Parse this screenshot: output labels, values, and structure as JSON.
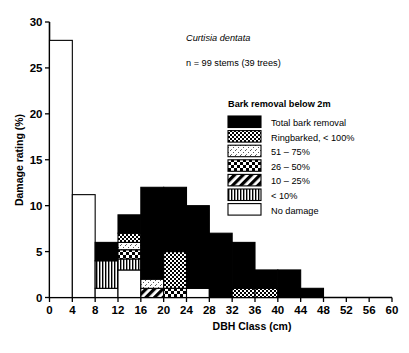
{
  "figure": {
    "species": "Curtisia dentata",
    "sample": "n = 99 stems (39 trees)"
  },
  "legend": {
    "title": "Bark removal below 2m",
    "entries": [
      {
        "key": "total",
        "label": "Total bark removal",
        "pattern": "solid-black"
      },
      {
        "key": "ringbarked",
        "label": "Ringbarked, < 100%",
        "pattern": "checker-dense"
      },
      {
        "key": "p51_75",
        "label": "51 – 75%",
        "pattern": "stipple-light"
      },
      {
        "key": "p26_50",
        "label": "26 – 50%",
        "pattern": "checker-coarse"
      },
      {
        "key": "p10_25",
        "label": "10 – 25%",
        "pattern": "diagonal-hatch"
      },
      {
        "key": "lt10",
        "label": "< 10%",
        "pattern": "vertical-lines"
      },
      {
        "key": "none",
        "label": "No damage",
        "pattern": "white"
      }
    ]
  },
  "chart_data": {
    "type": "bar",
    "subtype": "stacked-histogram",
    "title": "",
    "xlabel": "DBH Class (cm)",
    "ylabel": "Damage rating (%)",
    "xlim": [
      0,
      60
    ],
    "ylim": [
      0,
      30
    ],
    "xticks": [
      0,
      4,
      8,
      12,
      16,
      20,
      24,
      28,
      32,
      36,
      40,
      44,
      48,
      52,
      56,
      60
    ],
    "yticks": [
      0,
      5,
      10,
      15,
      20,
      25,
      30
    ],
    "grid": false,
    "legend_position": "inside-upper-right",
    "bin_width": 4,
    "categories": [
      "0-4",
      "4-8",
      "8-12",
      "12-16",
      "16-20",
      "20-24",
      "24-28",
      "28-32",
      "32-36",
      "36-40",
      "40-44",
      "44-48",
      "48-52",
      "52-56",
      "56-60"
    ],
    "series": [
      {
        "name": "No damage",
        "key": "none",
        "values": [
          28.0,
          11.2,
          1.0,
          3.0,
          0.0,
          0.0,
          1.0,
          0.0,
          0.0,
          0.0,
          0.0,
          0.0,
          0.0,
          0.0,
          0.0
        ]
      },
      {
        "name": "< 10%",
        "key": "lt10",
        "values": [
          0.0,
          0.0,
          3.0,
          1.2,
          0.0,
          0.0,
          0.0,
          0.0,
          0.0,
          0.0,
          0.0,
          0.0,
          0.0,
          0.0,
          0.0
        ]
      },
      {
        "name": "10 – 25%",
        "key": "p10_25",
        "values": [
          0.0,
          0.0,
          0.0,
          0.0,
          1.0,
          0.0,
          0.0,
          0.0,
          0.0,
          0.0,
          0.0,
          0.0,
          0.0,
          0.0,
          0.0
        ]
      },
      {
        "name": "26 – 50%",
        "key": "p26_50",
        "values": [
          0.0,
          0.0,
          0.0,
          1.0,
          0.0,
          1.0,
          0.0,
          0.0,
          0.0,
          0.0,
          0.0,
          0.0,
          0.0,
          0.0,
          0.0
        ]
      },
      {
        "name": "51 – 75%",
        "key": "p51_75",
        "values": [
          0.0,
          0.0,
          0.0,
          0.8,
          1.0,
          0.0,
          0.0,
          0.0,
          0.0,
          0.0,
          0.0,
          0.0,
          0.0,
          0.0,
          0.0
        ]
      },
      {
        "name": "Ringbarked, < 100%",
        "key": "ringbarked",
        "values": [
          0.0,
          0.0,
          0.0,
          1.0,
          0.0,
          4.0,
          0.0,
          0.0,
          1.0,
          1.0,
          0.0,
          0.0,
          0.0,
          0.0,
          0.0
        ]
      },
      {
        "name": "Total bark removal",
        "key": "total",
        "values": [
          0.0,
          0.0,
          2.0,
          2.0,
          10.0,
          7.0,
          9.0,
          7.0,
          5.0,
          2.0,
          3.0,
          1.0,
          0.0,
          0.0,
          0.0
        ]
      }
    ],
    "stack_totals": [
      28.0,
      11.2,
      6.0,
      9.0,
      12.0,
      12.0,
      10.0,
      7.0,
      6.0,
      3.0,
      3.0,
      1.0,
      0.0,
      0.0,
      0.0
    ],
    "annotations": [
      "Curtisia dentata",
      "n = 99 stems (39 trees)"
    ]
  }
}
